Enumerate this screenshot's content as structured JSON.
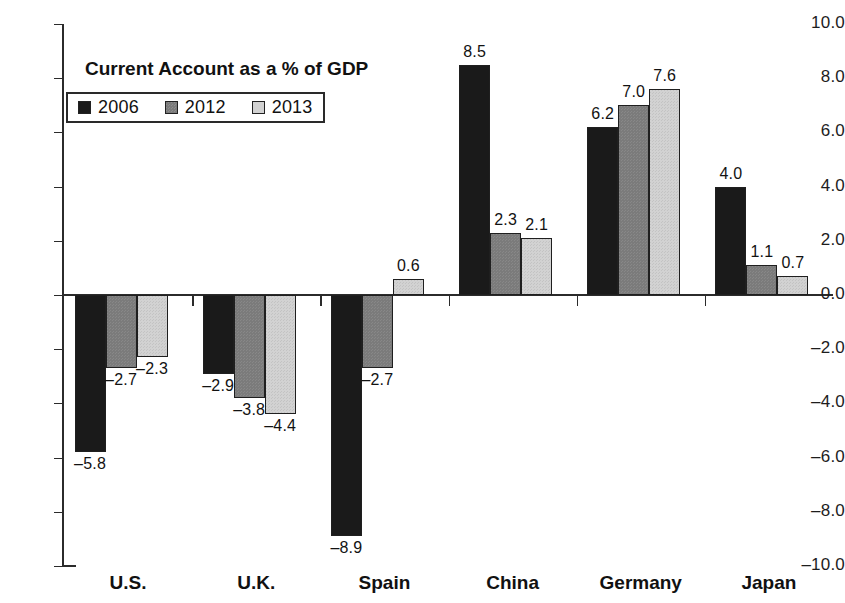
{
  "chart_data": {
    "type": "bar",
    "title": "Current Account as a % of GDP",
    "xlabel": "",
    "ylabel": "",
    "ylim": [
      -10.0,
      10.0
    ],
    "ytick_labels": [
      "10.0",
      "8.0",
      "6.0",
      "4.0",
      "2.0",
      "0.0",
      "-2.0",
      "-4.0",
      "-6.0",
      "-8.0",
      "-10.0"
    ],
    "ytick_values": [
      10.0,
      8.0,
      6.0,
      4.0,
      2.0,
      0.0,
      -2.0,
      -4.0,
      -6.0,
      -8.0,
      -10.0
    ],
    "grid": false,
    "legend_position": "upper-left-inside",
    "categories": [
      "U.S.",
      "U.K.",
      "Spain",
      "China",
      "Germany",
      "Japan"
    ],
    "series": [
      {
        "name": "2006",
        "color": "#1a1a1a",
        "values": [
          -5.8,
          -2.9,
          -8.9,
          8.5,
          6.2,
          4.0
        ],
        "labels": [
          "-5.8",
          "-2.9",
          "-8.9",
          "8.5",
          "6.2",
          "4.0"
        ]
      },
      {
        "name": "2012",
        "color": "#7b7b7b",
        "values": [
          -2.7,
          -3.8,
          -2.7,
          2.3,
          7.0,
          1.1
        ],
        "labels": [
          "-2.7",
          "-3.8",
          "-2.7",
          "2.3",
          "7.0",
          "1.1"
        ]
      },
      {
        "name": "2013",
        "color": "#d2d2d2",
        "values": [
          -2.3,
          -4.4,
          0.6,
          2.1,
          7.6,
          0.7
        ],
        "labels": [
          "-2.3",
          "-4.4",
          "0.6",
          "2.1",
          "7.6",
          "0.7"
        ]
      }
    ]
  },
  "legend": {
    "items": [
      {
        "label": "2006"
      },
      {
        "label": "2012"
      },
      {
        "label": "2013"
      }
    ]
  }
}
